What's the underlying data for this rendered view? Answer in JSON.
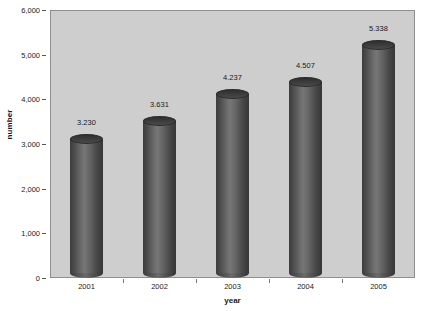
{
  "chart_data": {
    "type": "bar",
    "title": "",
    "xlabel": "year",
    "ylabel": "number",
    "categories": [
      "2001",
      "2002",
      "2003",
      "2004",
      "2005"
    ],
    "values": [
      3230,
      3631,
      4237,
      4507,
      5338
    ],
    "value_labels": [
      "3.230",
      "3.631",
      "4.237",
      "4.507",
      "5.338"
    ],
    "ylim": [
      0,
      6000
    ],
    "ytick_labels": [
      "0",
      "1,000",
      "2,000",
      "3,000",
      "4,000",
      "5,000",
      "6,000"
    ],
    "ytick_values": [
      0,
      1000,
      2000,
      3000,
      4000,
      5000,
      6000
    ],
    "grid": false,
    "legend": null,
    "series": [
      {
        "name": "number",
        "values": [
          3230,
          3631,
          4237,
          4507,
          5338
        ]
      }
    ],
    "style": {
      "bar_shape": "cylinder-3d",
      "bar_color": "#4a4a4a",
      "plot_background": "#cecece",
      "figure_background": "#ffffff",
      "axis_color": "#8f8f8f",
      "text_color": "#1a1a1a"
    }
  }
}
